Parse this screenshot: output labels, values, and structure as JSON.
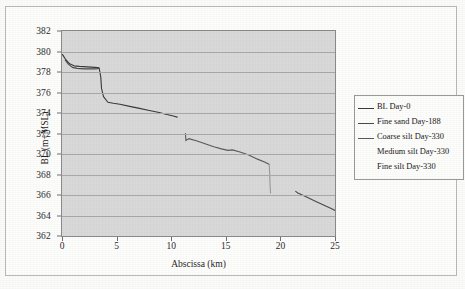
{
  "chart_data": {
    "type": "line",
    "title": "",
    "xlabel": "Abscissa (km)",
    "ylabel": "BL (m+MSL)",
    "xlim": [
      0,
      25
    ],
    "ylim": [
      362,
      382
    ],
    "xticks": [
      0,
      5,
      10,
      15,
      20,
      25
    ],
    "yticks": [
      362,
      364,
      366,
      368,
      370,
      372,
      374,
      376,
      378,
      380,
      382
    ],
    "grid": "horizontal",
    "legend_position": "right",
    "series": [
      {
        "name": "BL Day-0",
        "color": "#3a3a3a",
        "points": [
          [
            0.05,
            379.7
          ],
          [
            0.35,
            379.2
          ],
          [
            0.7,
            378.8
          ],
          [
            1.1,
            378.6
          ],
          [
            1.6,
            378.55
          ],
          [
            2.3,
            378.5
          ],
          [
            3.0,
            378.45
          ],
          [
            3.4,
            378.4
          ],
          [
            3.55,
            377.5
          ],
          [
            3.62,
            376.4
          ],
          [
            3.8,
            375.6
          ],
          [
            4.2,
            375.05
          ],
          [
            4.7,
            374.95
          ],
          [
            5.3,
            374.85
          ],
          [
            6.2,
            374.65
          ],
          [
            7.1,
            374.45
          ],
          [
            8.0,
            374.25
          ],
          [
            8.9,
            374.05
          ],
          [
            9.6,
            373.85
          ],
          [
            10.2,
            373.7
          ],
          [
            10.55,
            373.6
          ]
        ]
      },
      {
        "name": "Fine sand Day-188",
        "color": "#4a4a4a",
        "points": [
          [
            0.3,
            379.15
          ],
          [
            0.6,
            378.75
          ],
          [
            0.95,
            378.45
          ],
          [
            1.4,
            378.35
          ],
          [
            2.0,
            378.3
          ],
          [
            2.6,
            378.3
          ],
          [
            3.1,
            378.3
          ],
          [
            3.35,
            378.35
          ]
        ]
      },
      {
        "name": "Coarse silt Day-330",
        "color": "#5a5a5a",
        "points": [
          [
            11.3,
            372.0
          ],
          [
            11.35,
            371.3
          ],
          [
            11.6,
            371.5
          ],
          [
            12.3,
            371.3
          ],
          [
            13.1,
            371.0
          ],
          [
            13.9,
            370.7
          ],
          [
            14.6,
            370.5
          ],
          [
            15.2,
            370.35
          ],
          [
            15.6,
            370.4
          ],
          [
            16.3,
            370.2
          ],
          [
            17.1,
            369.9
          ],
          [
            17.9,
            369.5
          ],
          [
            18.6,
            369.2
          ],
          [
            18.95,
            369.0
          ]
        ]
      },
      {
        "name": "Medium silt Day-330",
        "color": "#9a9a9a",
        "points": [
          [
            18.98,
            369.0
          ],
          [
            19.02,
            368.0
          ],
          [
            19.05,
            367.0
          ],
          [
            19.1,
            366.2
          ]
        ]
      },
      {
        "name": "Fine silt Day-330",
        "color": "#4a4a4a",
        "points": [
          [
            21.4,
            366.35
          ],
          [
            21.6,
            366.2
          ],
          [
            22.4,
            365.8
          ],
          [
            23.2,
            365.4
          ],
          [
            24.0,
            365.0
          ],
          [
            24.7,
            364.65
          ],
          [
            25.0,
            364.5
          ]
        ]
      }
    ]
  },
  "axes": {
    "ylabel": "BL (m+MSL)",
    "xlabel": "Abscissa (km)",
    "yticks": [
      "382",
      "380",
      "378",
      "376",
      "374",
      "372",
      "370",
      "368",
      "366",
      "364",
      "362"
    ],
    "xticks": [
      "0",
      "5",
      "10",
      "15",
      "20",
      "25"
    ]
  },
  "legend": {
    "items": [
      {
        "label": "BL Day-0",
        "color": "#3a3a3a",
        "has_swatch": true
      },
      {
        "label": "Fine sand Day-188",
        "color": "#4a4a4a",
        "has_swatch": true
      },
      {
        "label": "Coarse silt Day-330",
        "color": "#5a5a5a",
        "has_swatch": true
      },
      {
        "label": "Medium silt Day-330",
        "color": "#9a9a9a",
        "has_swatch": false
      },
      {
        "label": "Fine silt Day-330",
        "color": "#4a4a4a",
        "has_swatch": false
      }
    ]
  }
}
